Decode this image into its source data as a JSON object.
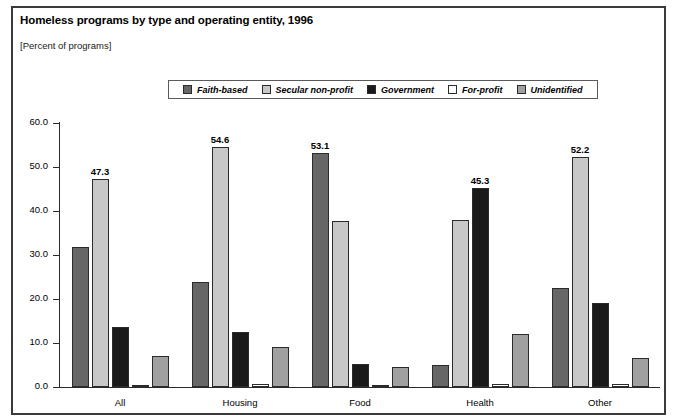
{
  "figure": {
    "title": "Homeless programs by type and operating entity, 1996",
    "subtitle": "[Percent of programs]"
  },
  "legend": {
    "items": [
      {
        "label": "Faith-based",
        "color": "#666666"
      },
      {
        "label": "Secular non-profit",
        "color": "#c8c8c8"
      },
      {
        "label": "Government",
        "color": "#1a1a1a"
      },
      {
        "label": "For-profit",
        "color": "#ffffff"
      },
      {
        "label": "Unidentified",
        "color": "#a0a0a0"
      }
    ]
  },
  "axes": {
    "y_ticks": [
      "0.0",
      "10.0",
      "20.0",
      "30.0",
      "40.0",
      "50.0",
      "60.0"
    ],
    "x_labels": [
      "All",
      "Housing",
      "Food",
      "Health",
      "Other"
    ]
  },
  "chart_data": {
    "type": "bar",
    "title": "Homeless programs by type and operating entity, 1996",
    "subtitle": "[Percent of programs]",
    "xlabel": "",
    "ylabel": "",
    "ylim": [
      0,
      60
    ],
    "ytick_step": 10,
    "grid": false,
    "legend_position": "top-center",
    "categories": [
      "All",
      "Housing",
      "Food",
      "Health",
      "Other"
    ],
    "series": [
      {
        "name": "Faith-based",
        "color": "#666666",
        "values": [
          31.8,
          23.9,
          53.1,
          5.0,
          22.5
        ]
      },
      {
        "name": "Secular non-profit",
        "color": "#c8c8c8",
        "values": [
          47.3,
          54.6,
          37.7,
          38.0,
          52.2
        ]
      },
      {
        "name": "Government",
        "color": "#1a1a1a",
        "values": [
          13.7,
          12.5,
          5.2,
          45.3,
          19.2
        ]
      },
      {
        "name": "For-profit",
        "color": "#ffffff",
        "values": [
          0.5,
          0.7,
          0.3,
          0.6,
          0.6
        ]
      },
      {
        "name": "Unidentified",
        "color": "#a0a0a0",
        "values": [
          7.0,
          9.0,
          4.5,
          12.0,
          6.5
        ]
      }
    ],
    "data_labels": [
      {
        "category": "All",
        "series": "Secular non-profit",
        "text": "47.3"
      },
      {
        "category": "Housing",
        "series": "Secular non-profit",
        "text": "54.6"
      },
      {
        "category": "Food",
        "series": "Faith-based",
        "text": "53.1"
      },
      {
        "category": "Health",
        "series": "Government",
        "text": "45.3"
      },
      {
        "category": "Other",
        "series": "Secular non-profit",
        "text": "52.2"
      }
    ]
  }
}
